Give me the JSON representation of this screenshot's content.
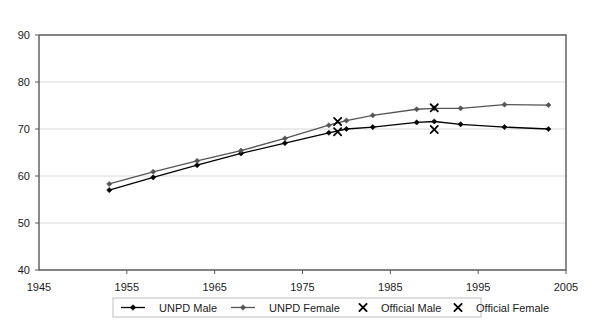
{
  "chart_data": {
    "type": "line",
    "title": "",
    "subtitle": "",
    "xlabel": "",
    "ylabel": "",
    "xlim": [
      1945,
      2005
    ],
    "ylim": [
      40,
      90
    ],
    "xticks": [
      1945,
      1955,
      1965,
      1975,
      1985,
      1995,
      2005
    ],
    "yticks": [
      40,
      50,
      60,
      70,
      80,
      90
    ],
    "xtick_labels": [
      "1945",
      "1955",
      "1965",
      "1975",
      "1985",
      "1995",
      "2005"
    ],
    "ytick_labels": [
      "40",
      "50",
      "60",
      "70",
      "80",
      "90"
    ],
    "grid": "horizontal",
    "legend_position": "bottom",
    "series": [
      {
        "name": "UNPD Male",
        "type": "line",
        "marker": "diamond",
        "color": "#000000",
        "x": [
          1953,
          1958,
          1963,
          1968,
          1973,
          1978,
          1980,
          1983,
          1988,
          1990,
          1993,
          1998,
          2003
        ],
        "values": [
          57.0,
          59.7,
          62.3,
          64.8,
          67.0,
          69.2,
          70.0,
          70.4,
          71.4,
          71.6,
          71.0,
          70.4,
          70.0
        ]
      },
      {
        "name": "UNPD Female",
        "type": "line",
        "marker": "diamond",
        "color": "#555555",
        "x": [
          1953,
          1958,
          1963,
          1968,
          1973,
          1978,
          1980,
          1983,
          1988,
          1990,
          1993,
          1998,
          2003
        ],
        "values": [
          58.3,
          60.9,
          63.2,
          65.4,
          68.0,
          70.8,
          71.8,
          72.9,
          74.2,
          74.4,
          74.4,
          75.2,
          75.1
        ]
      },
      {
        "name": "Official Male",
        "type": "scatter",
        "marker": "x",
        "color": "#000000",
        "x": [
          1979,
          1990
        ],
        "values": [
          69.4,
          69.9
        ]
      },
      {
        "name": "Official Female",
        "type": "scatter",
        "marker": "x",
        "color": "#000000",
        "x": [
          1979,
          1990
        ],
        "values": [
          71.6,
          74.5
        ]
      }
    ],
    "legend_entries": [
      {
        "label": "UNPD Male",
        "marker": "line-diamond",
        "color": "#000000"
      },
      {
        "label": "UNPD Female",
        "marker": "line-diamond",
        "color": "#555555"
      },
      {
        "label": "Official Male",
        "marker": "x",
        "color": "#000000"
      },
      {
        "label": "Official Female",
        "marker": "x",
        "color": "#000000"
      }
    ],
    "colors": {
      "background": "#ffffff",
      "plot_border": "#595959",
      "gridline": "#d9d9d9",
      "unpd_male": "#000000",
      "unpd_female": "#555555",
      "official": "#000000",
      "text": "#1a1a1a",
      "legend_border": "#bfbfbf"
    }
  }
}
